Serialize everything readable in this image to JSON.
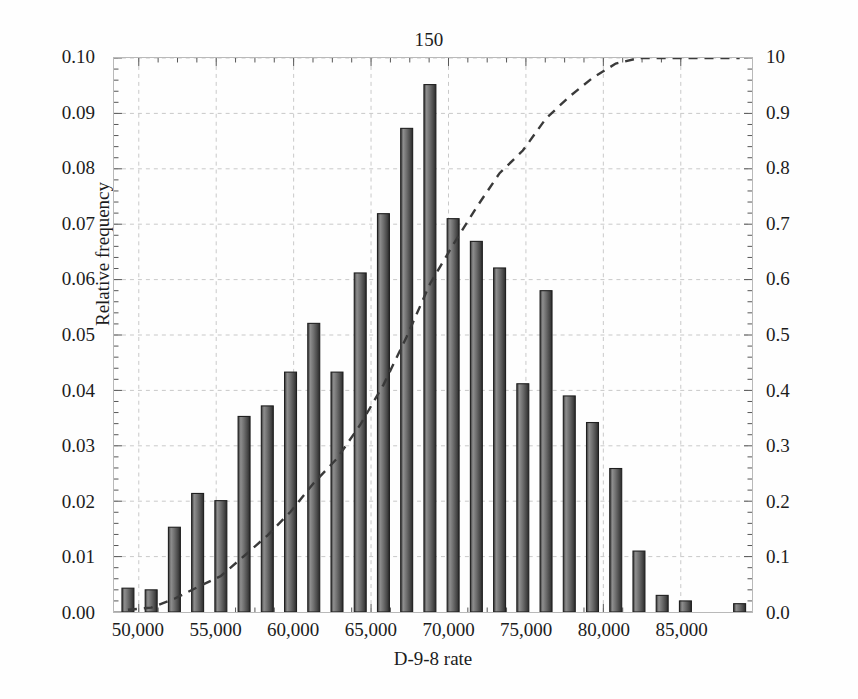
{
  "chart_data": {
    "type": "bar",
    "title": "150",
    "xlabel": "D-9-8 rate",
    "ylabel": "Relative frequency",
    "y2label": "Cumulative probability",
    "grid": true,
    "legend": "none",
    "xlim": [
      48400,
      89600
    ],
    "ylim": [
      0.0,
      0.1
    ],
    "y2lim": [
      0.0,
      1.0
    ],
    "xticks": [
      50000,
      55000,
      60000,
      65000,
      70000,
      75000,
      80000,
      85000
    ],
    "xticklabels": [
      "50,000",
      "55,000",
      "60,000",
      "65,000",
      "70,000",
      "75,000",
      "80,000",
      "85,000"
    ],
    "yticks": [
      0.0,
      0.01,
      0.02,
      0.03,
      0.04,
      0.05,
      0.06,
      0.07,
      0.08,
      0.09,
      0.1
    ],
    "yticklabels": [
      "0.00",
      "0.01",
      "0.02",
      "0.03",
      "0.04",
      "0.05",
      "0.06",
      "0.07",
      "0.08",
      "0.09",
      "0.10"
    ],
    "y2ticks": [
      0.0,
      0.1,
      0.2,
      0.3,
      0.4,
      0.5,
      0.6,
      0.7,
      0.8,
      0.9,
      1.0
    ],
    "y2ticklabels": [
      "0.0",
      "0.1",
      "0.2",
      "0.3",
      "0.4",
      "0.5",
      "0.6",
      "0.7",
      "0.8",
      "0.9",
      "10"
    ],
    "bar_color": "#6b6b6b",
    "bar_edge_color": "#1f1f1f",
    "curve_color": "#3a3a3a",
    "curve_style": "dashed",
    "categories": [
      49300,
      50800,
      52300,
      53800,
      55300,
      56800,
      58300,
      59800,
      61300,
      62800,
      64300,
      65800,
      67300,
      68800,
      70300,
      71800,
      73300,
      74800,
      76300,
      77800,
      79300,
      80800,
      82300,
      83800,
      85300,
      88800
    ],
    "values": [
      0.0043,
      0.004,
      0.0153,
      0.0214,
      0.0201,
      0.0353,
      0.0372,
      0.0433,
      0.0521,
      0.0433,
      0.0612,
      0.0719,
      0.0873,
      0.0952,
      0.071,
      0.0669,
      0.0621,
      0.0412,
      0.058,
      0.039,
      0.0342,
      0.0259,
      0.011,
      0.003,
      0.002,
      0.0015
    ],
    "series": [
      {
        "name": "Relative frequency",
        "axis": "left",
        "values": [
          0.0043,
          0.004,
          0.0153,
          0.0214,
          0.0201,
          0.0353,
          0.0372,
          0.0433,
          0.0521,
          0.0433,
          0.0612,
          0.0719,
          0.0873,
          0.0952,
          0.071,
          0.0669,
          0.0621,
          0.0412,
          0.058,
          0.039,
          0.0342,
          0.0259,
          0.011,
          0.003,
          0.002,
          0.0015
        ]
      },
      {
        "name": "Cumulative probability",
        "axis": "right",
        "x": [
          49300,
          50800,
          52300,
          53800,
          55300,
          56800,
          58300,
          59800,
          61300,
          62800,
          64300,
          65800,
          67300,
          68800,
          70300,
          71800,
          73300,
          74800,
          76300,
          77800,
          79300,
          80800,
          82300,
          83800,
          85300,
          88800
        ],
        "values": [
          0.004,
          0.008,
          0.024,
          0.045,
          0.065,
          0.101,
          0.138,
          0.181,
          0.233,
          0.277,
          0.338,
          0.41,
          0.497,
          0.592,
          0.663,
          0.73,
          0.792,
          0.833,
          0.891,
          0.93,
          0.964,
          0.99,
          1.0,
          1.0,
          1.0,
          1.0
        ]
      }
    ]
  }
}
